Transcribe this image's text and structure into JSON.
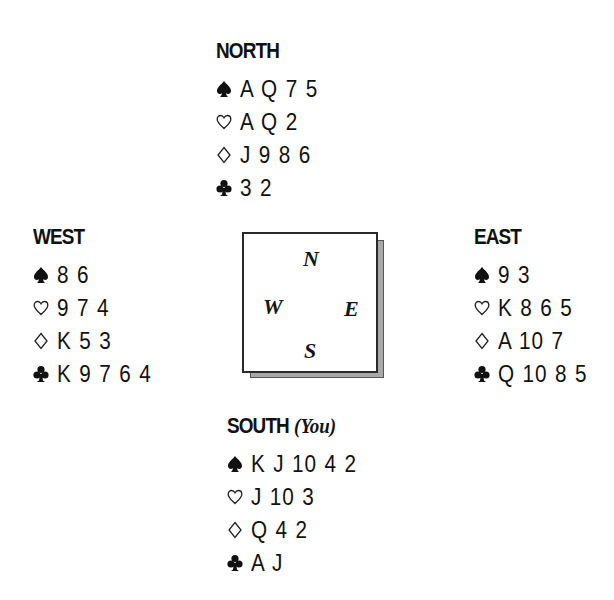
{
  "hands": {
    "north": {
      "title": "NORTH",
      "note": "",
      "spades": "A Q 7 5",
      "hearts": "A Q 2",
      "diamonds": "J 9 8 6",
      "clubs": "3 2"
    },
    "west": {
      "title": "WEST",
      "note": "",
      "spades": "8 6",
      "hearts": "9 7 4",
      "diamonds": "K 5 3",
      "clubs": "K 9 7 6 4"
    },
    "east": {
      "title": "EAST",
      "note": "",
      "spades": "9 3",
      "hearts": "K 8 6 5",
      "diamonds": "A 10 7",
      "clubs": "Q 10 8 5"
    },
    "south": {
      "title": "SOUTH",
      "note": "(You)",
      "spades": "K J 10 4 2",
      "hearts": "J 10 3",
      "diamonds": "Q 4 2",
      "clubs": "A J"
    }
  },
  "compass": {
    "north": "N",
    "west": "W",
    "east": "E",
    "south": "S"
  },
  "suit_icons": {
    "spades": "spade-icon",
    "hearts": "heart-outline-icon",
    "diamonds": "diamond-outline-icon",
    "clubs": "club-icon"
  }
}
